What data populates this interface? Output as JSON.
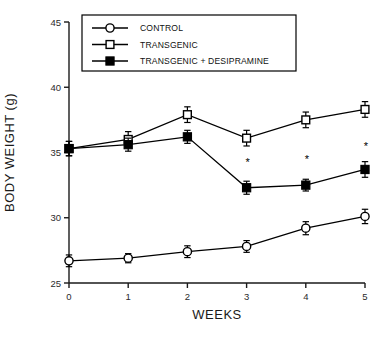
{
  "chart_data": {
    "type": "line",
    "title": "",
    "xlabel": "WEEKS",
    "ylabel": "BODY WEIGHT (g)",
    "x": [
      0,
      1,
      2,
      3,
      4,
      5
    ],
    "xticklabels": [
      "0",
      "1",
      "2",
      "3",
      "4",
      "5"
    ],
    "yticklabels": [
      "25",
      "30",
      "35",
      "40",
      "45"
    ],
    "yticks": [
      25,
      30,
      35,
      40,
      45
    ],
    "xlim": [
      0,
      5
    ],
    "ylim": [
      25,
      45
    ],
    "grid": false,
    "legend_position": "top-left-inside-box",
    "series": [
      {
        "name": "CONTROL",
        "marker": "open-circle",
        "values": [
          26.7,
          26.9,
          27.4,
          27.8,
          29.2,
          30.1
        ],
        "errors": [
          0.45,
          0.35,
          0.45,
          0.45,
          0.5,
          0.55
        ]
      },
      {
        "name": "TRANSGENIC",
        "marker": "open-square",
        "values": [
          35.3,
          36.0,
          37.9,
          36.1,
          37.5,
          38.3
        ],
        "errors": [
          0.55,
          0.6,
          0.6,
          0.6,
          0.6,
          0.6
        ]
      },
      {
        "name": "TRANSGENIC + DESIPRAMINE",
        "marker": "filled-square",
        "values": [
          35.3,
          35.6,
          36.2,
          32.3,
          32.5,
          33.7
        ],
        "errors": [
          0.55,
          0.5,
          0.5,
          0.5,
          0.45,
          0.6
        ]
      }
    ],
    "annotations": [
      {
        "text": "*",
        "x": 3,
        "y": 34.0,
        "series": "TRANSGENIC + DESIPRAMINE"
      },
      {
        "text": "*",
        "x": 4,
        "y": 34.2,
        "series": "TRANSGENIC + DESIPRAMINE"
      },
      {
        "text": "*",
        "x": 5,
        "y": 35.2,
        "series": "TRANSGENIC + DESIPRAMINE"
      }
    ]
  },
  "legend": {
    "entries": [
      {
        "label": "CONTROL",
        "marker": "open-circle"
      },
      {
        "label": "TRANSGENIC",
        "marker": "open-square"
      },
      {
        "label": "TRANSGENIC + DESIPRAMINE",
        "marker": "filled-square"
      }
    ]
  },
  "colors": {
    "line": "#000000",
    "marker_fill_open": "#ffffff",
    "marker_fill_solid": "#000000",
    "axis": "#1a1a1a",
    "background": "#ffffff"
  }
}
